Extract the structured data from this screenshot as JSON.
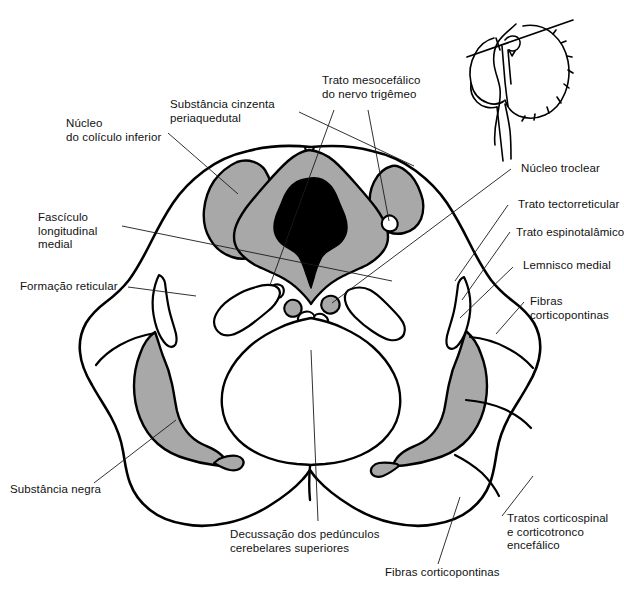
{
  "figure": {
    "type": "anatomical-cross-section",
    "colors": {
      "outline": "#000000",
      "gray_matter_fill": "#a8a8a8",
      "aqueduct_fill": "#000000",
      "background": "#ffffff",
      "leader_line": "#1a1a1a"
    },
    "inset": {
      "name": "brainstem-sagittal-inset",
      "description": "Vista sagital do tronco encefálico com linha do plano de secção"
    }
  },
  "labels": {
    "nucleo_coliculo_inferior": "Núcleo\ndo colículo inferior",
    "substancia_cinzenta_periaquedutal": "Substância cinzenta\nperiaquedutal",
    "trato_mesocefalico": "Trato mesocefálico\ndo nervo trigêmeo",
    "fasciculo_longitudinal_medial": "Fascículo\nlongitudinal\nmedial",
    "formacao_reticular": "Formação reticular",
    "substancia_negra": "Substância negra",
    "decussacao_pedunculos": "Decussação dos pedúnculos\ncerebelares superiores",
    "fibras_corticopontinas_inferior": "Fibras corticopontinas",
    "nucleo_troclear": "Núcleo troclear",
    "trato_tectorreticular": "Trato tectorreticular",
    "trato_espinotalamico": "Trato espinotalâmico",
    "lemnisco_medial": "Lemnisco medial",
    "fibras_corticopontinas_direita": "Fibras\ncorticopontinas",
    "tratos_corticospinal": "Tratos corticospinal\ne corticotronco\nencefálico"
  },
  "regions": [
    {
      "name": "inferior-colliculus-nucleus-left",
      "fill": "gray"
    },
    {
      "name": "inferior-colliculus-nucleus-right",
      "fill": "gray"
    },
    {
      "name": "periaqueductal-gray",
      "fill": "gray"
    },
    {
      "name": "cerebral-aqueduct",
      "fill": "black"
    },
    {
      "name": "substantia-nigra-left",
      "fill": "gray"
    },
    {
      "name": "substantia-nigra-right",
      "fill": "gray"
    },
    {
      "name": "decussation-superior-cerebellar-peduncles",
      "fill": "white"
    },
    {
      "name": "medial-lemniscus-left",
      "fill": "white"
    },
    {
      "name": "medial-lemniscus-right",
      "fill": "white"
    }
  ]
}
